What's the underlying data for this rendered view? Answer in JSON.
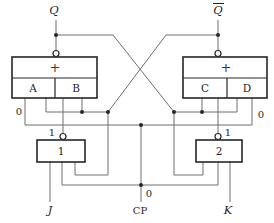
{
  "diagram": {
    "title_hint": "JK flip-flop gate-level schematic",
    "outputs": {
      "q": "Q",
      "q_bar": "Q"
    },
    "left_aoi": {
      "plus": "+",
      "cell_a": "A",
      "cell_b": "B"
    },
    "right_aoi": {
      "plus": "+",
      "cell_c": "C",
      "cell_d": "D"
    },
    "gate1": {
      "label": "1",
      "output_value": "1"
    },
    "gate2": {
      "label": "2",
      "output_value": "1"
    },
    "signal_values": {
      "left_zero": "0",
      "right_zero": "0",
      "clock_zero": "0"
    },
    "inputs": {
      "j": "J",
      "k": "K",
      "clock": "CP"
    }
  },
  "colors": {
    "wire": "#6e6e6e",
    "box": "#262626",
    "text": "#1f1f1f",
    "background": "#ffffff"
  }
}
